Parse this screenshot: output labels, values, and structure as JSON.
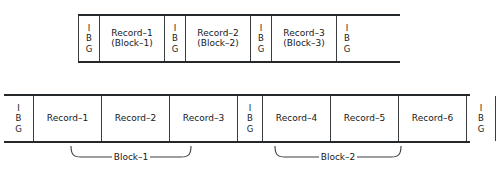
{
  "diagram": {
    "top_tape": {
      "name": "unblocked-records-tape",
      "cells": [
        {
          "type": "ibg",
          "letters": [
            "I",
            "B",
            "G"
          ]
        },
        {
          "type": "record",
          "lines": [
            "Record–1",
            "(Block–1)"
          ]
        },
        {
          "type": "ibg",
          "letters": [
            "I",
            "B",
            "G"
          ]
        },
        {
          "type": "record",
          "lines": [
            "Record–2",
            "(Block–2)"
          ]
        },
        {
          "type": "ibg",
          "letters": [
            "I",
            "B",
            "G"
          ]
        },
        {
          "type": "record",
          "lines": [
            "Record–3",
            "(Block–3)"
          ]
        },
        {
          "type": "ibg",
          "letters": [
            "I",
            "B",
            "G"
          ]
        },
        {
          "type": "open",
          "lines": []
        }
      ]
    },
    "bottom_tape": {
      "name": "blocked-records-tape",
      "cells": [
        {
          "type": "ibg",
          "letters": [
            "I",
            "B",
            "G"
          ]
        },
        {
          "type": "record",
          "lines": [
            "Record–1"
          ]
        },
        {
          "type": "record",
          "lines": [
            "Record–2"
          ]
        },
        {
          "type": "record",
          "lines": [
            "Record–3"
          ]
        },
        {
          "type": "ibg",
          "letters": [
            "I",
            "B",
            "G"
          ]
        },
        {
          "type": "record",
          "lines": [
            "Record–4"
          ]
        },
        {
          "type": "record",
          "lines": [
            "Record–5"
          ]
        },
        {
          "type": "record",
          "lines": [
            "Record–6"
          ]
        },
        {
          "type": "ibg",
          "letters": [
            "I",
            "B",
            "G"
          ]
        }
      ]
    },
    "braces": [
      {
        "name": "block-1-brace",
        "label": "Block–1"
      },
      {
        "name": "block-2-brace",
        "label": "Block–2"
      }
    ],
    "colors": {
      "rail": "#25282b",
      "divider": "#3a3d40",
      "text": "#16181a",
      "background": "#ffffff"
    }
  }
}
